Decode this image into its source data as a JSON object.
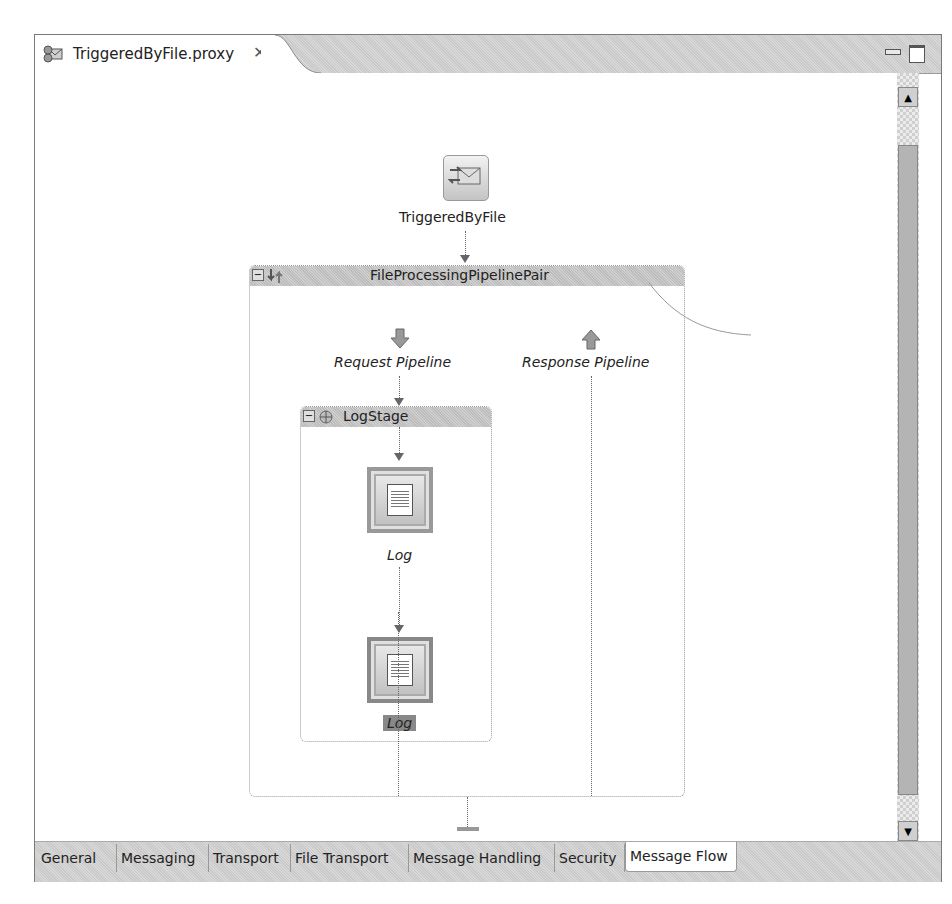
{
  "editor": {
    "tab_title": "TriggeredByFile.proxy",
    "tab_icon": "proxy-service-icon",
    "close_glyph": "✕",
    "minimize_icon": "minimize-icon",
    "maximize_icon": "maximize-icon"
  },
  "diagram": {
    "proxy_node": {
      "label": "TriggeredByFile",
      "icon": "proxy-envelope-icon"
    },
    "pipeline_pair": {
      "label": "FileProcessingPipelinePair",
      "collapse_glyph": "−",
      "request": {
        "label": "Request Pipeline",
        "icon": "down-arrow-icon"
      },
      "response": {
        "label": "Response Pipeline",
        "icon": "up-arrow-icon"
      }
    },
    "stage": {
      "label": "LogStage",
      "collapse_glyph": "−",
      "actions": [
        {
          "label": "Log",
          "selected": false
        },
        {
          "label": "Log",
          "selected": true
        }
      ]
    }
  },
  "scrollbar": {
    "up": "▲",
    "down": "▼"
  },
  "bottom_tabs": [
    {
      "label": "General",
      "active": false
    },
    {
      "label": "Messaging",
      "active": false
    },
    {
      "label": "Transport",
      "active": false
    },
    {
      "label": "File Transport",
      "active": false
    },
    {
      "label": "Message Handling",
      "active": false
    },
    {
      "label": "Security",
      "active": false
    },
    {
      "label": "Message Flow",
      "active": true
    }
  ]
}
